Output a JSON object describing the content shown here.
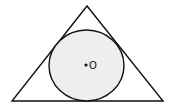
{
  "diagram": {
    "triangle": {
      "points": [
        [
          87,
          6
        ],
        [
          12,
          101
        ],
        [
          163,
          101
        ]
      ],
      "stroke": "#111111"
    },
    "circle": {
      "cx": 86.5,
      "cy": 65.5,
      "rx": 37.5,
      "ry": 35.5,
      "fill": "#eeeeee",
      "stroke": "#111111"
    },
    "center_point": {
      "x": 86,
      "y": 65
    },
    "center_label": "O"
  }
}
